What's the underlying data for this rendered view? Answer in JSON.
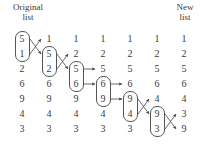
{
  "headers": {
    "left_line1": "Original",
    "left_line2": "list",
    "right_line1": "New",
    "right_line2": "list"
  },
  "chart_data": {
    "type": "diagram",
    "xlabel": "",
    "ylabel": "",
    "columns": [
      {
        "label": "Original list",
        "values": [
          5,
          1,
          2,
          6,
          9,
          4,
          3
        ],
        "box_rows": [
          1,
          2
        ],
        "swap": true
      },
      {
        "label": "step 2",
        "values": [
          1,
          5,
          2,
          6,
          9,
          4,
          3
        ],
        "box_rows": [
          2,
          3
        ],
        "swap": true
      },
      {
        "label": "step 3",
        "values": [
          1,
          2,
          5,
          6,
          9,
          4,
          3
        ],
        "box_rows": [
          3,
          4
        ],
        "swap": false
      },
      {
        "label": "step 4",
        "values": [
          1,
          2,
          5,
          6,
          9,
          4,
          3
        ],
        "box_rows": [
          4,
          5
        ],
        "swap": false
      },
      {
        "label": "step 5",
        "values": [
          1,
          2,
          5,
          6,
          9,
          4,
          3
        ],
        "box_rows": [
          5,
          6
        ],
        "swap": true
      },
      {
        "label": "step 6",
        "values": [
          1,
          2,
          5,
          6,
          4,
          9,
          3
        ],
        "box_rows": [
          6,
          7
        ],
        "swap": true
      },
      {
        "label": "New list",
        "values": [
          1,
          2,
          5,
          6,
          4,
          3,
          9
        ],
        "box_rows": [],
        "swap": false
      }
    ],
    "row_count": 7,
    "column_count": 7,
    "accent": "#3a3a3a",
    "stroke": "#555555"
  }
}
